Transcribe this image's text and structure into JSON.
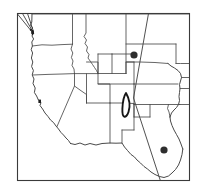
{
  "figure": {
    "type": "map",
    "background_color": "#ffffff",
    "frame": {
      "x": 17,
      "y": 13,
      "width": 173,
      "height": 168,
      "stroke_color": "#3a3a3a",
      "fill_color": "#ffffff"
    }
  },
  "map": {
    "region_label": "Western United States",
    "boundary_style": {
      "state_line_color": "#4a4a4a",
      "coast_line_color": "#3f3f3f"
    },
    "states_depicted": [
      "Washington",
      "Oregon",
      "California",
      "Idaho",
      "Nevada",
      "Utah",
      "Arizona",
      "Montana",
      "Wyoming",
      "Colorado",
      "New Mexico",
      "North Dakota",
      "South Dakota",
      "Nebraska",
      "Kansas",
      "Oklahoma",
      "Texas"
    ]
  },
  "markers": {
    "legend_note": "Filled circles mark point localities; outlined shape marks a range polygon",
    "dot_color": "#2e2e2e",
    "blob_color": "#1f1f1f",
    "range_outline_color": "#161616",
    "points": [
      {
        "name": "marker-puget-sound",
        "label": "Puget Sound",
        "shape": "blob",
        "x": 30,
        "y": 31,
        "size": 5
      },
      {
        "name": "marker-san-francisco-bay",
        "label": "San Francisco Bay",
        "shape": "blob",
        "x": 40,
        "y": 101,
        "size": 3
      },
      {
        "name": "marker-northern-colorado",
        "label": "Northern Colorado",
        "shape": "dot",
        "x": 134,
        "y": 55,
        "size": 7
      },
      {
        "name": "marker-southern-texas",
        "label": "Southern Texas",
        "shape": "dot",
        "x": 164,
        "y": 150,
        "size": 7
      }
    ],
    "range_polygon": {
      "name": "range-outline-western-kansas",
      "label": "Western Kansas range",
      "x": 122,
      "y": 93,
      "width": 9,
      "height": 24
    }
  },
  "lines": {
    "flyway_label": "Migration route lines",
    "color": "#3c3c3c",
    "count": 4
  }
}
